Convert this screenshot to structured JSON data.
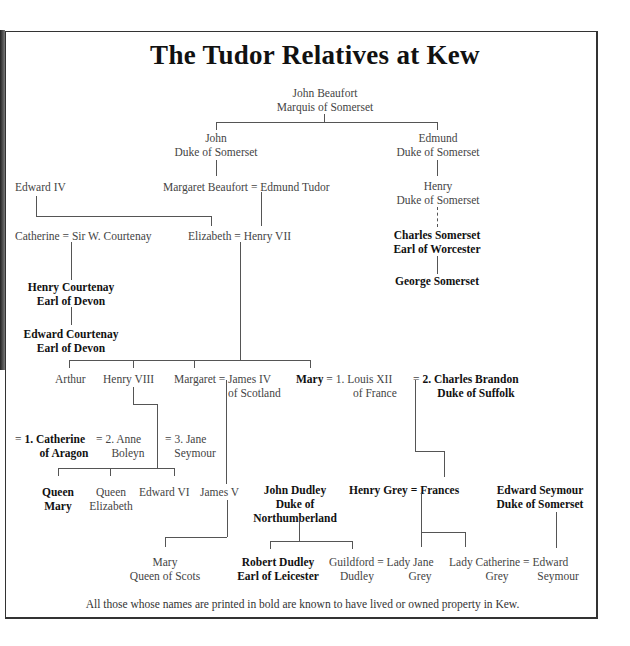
{
  "title": "The Tudor Relatives at Kew",
  "footnote": "All those whose names are printed in bold are known to have lived or owned property in Kew.",
  "people": {
    "john_beaufort": {
      "line1": "John Beaufort",
      "line2": "Marquis of Somerset",
      "bold": false
    },
    "john_somerset": {
      "line1": "John",
      "line2": "Duke of Somerset",
      "bold": false
    },
    "edmund_somerset": {
      "line1": "Edmund",
      "line2": "Duke of Somerset",
      "bold": false
    },
    "edward_iv": {
      "line1": "Edward IV",
      "bold": false
    },
    "margaret_beaufort": {
      "line1": "Margaret Beaufort",
      "bold": false
    },
    "edmund_tudor": {
      "line1": "Edmund Tudor",
      "bold": false
    },
    "henry_somerset": {
      "line1": "Henry",
      "line2": "Duke of Somerset",
      "bold": false
    },
    "catherine": {
      "line1": "Catherine",
      "bold": false
    },
    "sir_w_courtenay": {
      "line1": "Sir W. Courtenay",
      "bold": false
    },
    "elizabeth": {
      "line1": "Elizabeth",
      "bold": false
    },
    "henry_vii": {
      "line1": "Henry VII",
      "bold": false
    },
    "charles_somerset": {
      "line1": "Charles Somerset",
      "line2": "Earl of Worcester",
      "bold": true
    },
    "george_somerset": {
      "line1": "George Somerset",
      "bold": true
    },
    "henry_courtenay": {
      "line1": "Henry Courtenay",
      "line2": "Earl of Devon",
      "bold": true
    },
    "edward_courtenay": {
      "line1": "Edward Courtenay",
      "line2": "Earl of Devon",
      "bold": true
    },
    "arthur": {
      "line1": "Arthur",
      "bold": false
    },
    "henry_viii": {
      "line1": "Henry VIII",
      "bold": false
    },
    "margaret": {
      "line1": "Margaret",
      "bold": false
    },
    "james_iv": {
      "line1": "James IV",
      "line2": "of Scotland",
      "bold": false
    },
    "mary_tudor": {
      "line1": "Mary",
      "bold": true
    },
    "louis_xii": {
      "line1": "1. Louis XII",
      "line2": "of France",
      "bold": false
    },
    "charles_brandon": {
      "line1": "2. Charles Brandon",
      "line2": "Duke of Suffolk",
      "bold": true
    },
    "catherine_aragon": {
      "line1": "1. Catherine",
      "line2": "of Aragon",
      "bold": true
    },
    "anne_boleyn": {
      "line1": "2. Anne",
      "line2": "Boleyn",
      "bold": false
    },
    "jane_seymour": {
      "line1": "3. Jane",
      "line2": "Seymour",
      "bold": false
    },
    "queen_mary": {
      "line1": "Queen",
      "line2": "Mary",
      "bold": true
    },
    "queen_elizabeth": {
      "line1": "Queen",
      "line2": "Elizabeth",
      "bold": false
    },
    "edward_vi": {
      "line1": "Edward VI",
      "bold": false
    },
    "james_v": {
      "line1": "James V",
      "bold": false
    },
    "john_dudley": {
      "line1": "John Dudley",
      "line2": "Duke of",
      "line3": "Northumberland",
      "bold": true
    },
    "henry_grey": {
      "line1": "Henry Grey",
      "bold": true
    },
    "frances": {
      "line1": "Frances",
      "bold": true
    },
    "edward_seymour_duke": {
      "line1": "Edward Seymour",
      "line2": "Duke of Somerset",
      "bold": true
    },
    "mary_queen_of_scots": {
      "line1": "Mary",
      "line2": "Queen of Scots",
      "bold": false
    },
    "robert_dudley": {
      "line1": "Robert Dudley",
      "line2": "Earl of Leicester",
      "bold": true
    },
    "guildford_dudley": {
      "line1": "Guildford",
      "line2": "Dudley",
      "bold": false
    },
    "lady_jane_grey": {
      "line1": "Lady Jane",
      "line2": "Grey",
      "bold": false
    },
    "lady_catherine_grey": {
      "line1": "Lady Catherine",
      "line2": "Grey",
      "bold": false
    },
    "edward_seymour": {
      "line1": "Edward",
      "line2": "Seymour",
      "bold": false
    }
  },
  "symbols": {
    "marriage": "="
  }
}
